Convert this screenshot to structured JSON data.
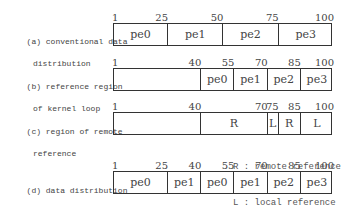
{
  "rows": [
    {
      "id": "a",
      "label_line1": "(a) conventional data",
      "label_line2": "distribution",
      "ticks": [
        "1",
        "25",
        "50",
        "75",
        "100"
      ],
      "segments": [
        {
          "label": "pe0",
          "from": 1,
          "to": 25
        },
        {
          "label": "pe1",
          "from": 25,
          "to": 50
        },
        {
          "label": "pe2",
          "from": 50,
          "to": 75
        },
        {
          "label": "pe3",
          "from": 75,
          "to": 100
        }
      ]
    },
    {
      "id": "b",
      "label_line1": "(b) reference region",
      "label_line2": "of kernel loop",
      "ticks": [
        "1",
        "40",
        "55",
        "70",
        "85",
        "100"
      ],
      "segments": [
        {
          "label": "",
          "from": 1,
          "to": 40
        },
        {
          "label": "pe0",
          "from": 40,
          "to": 55
        },
        {
          "label": "pe1",
          "from": 55,
          "to": 70
        },
        {
          "label": "pe2",
          "from": 70,
          "to": 85
        },
        {
          "label": "pe3",
          "from": 85,
          "to": 100
        }
      ]
    },
    {
      "id": "c",
      "label_line1": "(c) region of remote",
      "label_line2": "reference",
      "ticks": [
        "1",
        "40",
        "70",
        "75",
        "85",
        "100"
      ],
      "segments": [
        {
          "label": "",
          "from": 1,
          "to": 40
        },
        {
          "label": "R",
          "from": 40,
          "to": 70
        },
        {
          "label": "L",
          "from": 70,
          "to": 75
        },
        {
          "label": "R",
          "from": 75,
          "to": 85
        },
        {
          "label": "L",
          "from": 85,
          "to": 100
        }
      ]
    },
    {
      "id": "d",
      "label_line1": "(d) data distribution",
      "label_line2": "by our method",
      "ticks": [
        "1",
        "25",
        "40",
        "55",
        "70",
        "85",
        "100"
      ],
      "segments": [
        {
          "label": "pe0",
          "from": 1,
          "to": 25
        },
        {
          "label": "pe1",
          "from": 25,
          "to": 40
        },
        {
          "label": "pe0",
          "from": 40,
          "to": 55
        },
        {
          "label": "pe1",
          "from": 55,
          "to": 70
        },
        {
          "label": "pe2",
          "from": 70,
          "to": 85
        },
        {
          "label": "pe3",
          "from": 85,
          "to": 100
        }
      ]
    }
  ],
  "legend": {
    "r": "R : remote reference",
    "l": "L : local reference"
  }
}
